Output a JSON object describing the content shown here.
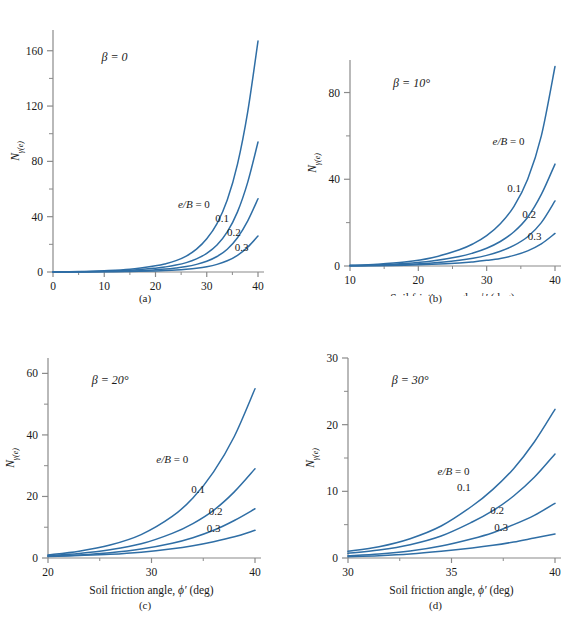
{
  "figure": {
    "background": "#ffffff",
    "curve_color": "#2f6ea5",
    "axis_color": "#8a8a8a",
    "text_color": "#1a1a1a"
  },
  "common": {
    "xlabel_prefix": "Soil friction angle,",
    "xlabel_symbol": "ϕ′",
    "xlabel_suffix": "(deg)",
    "ylabel_base": "N",
    "ylabel_sub": "γ(e)",
    "series_label_lead": "e/B = 0",
    "series_labels": [
      "e/B = 0",
      "0.1",
      "0.2",
      "0.3"
    ]
  },
  "chart_data": [
    {
      "id": "a",
      "caption": "(a)",
      "type": "line",
      "title": "",
      "annotation": "β = 0",
      "beta": "β = 0",
      "xlabel": "Soil friction angle, ϕ′ (deg)",
      "ylabel": "Nγ(e)",
      "xlim": [
        0,
        40
      ],
      "ylim": [
        0,
        175
      ],
      "xticks": [
        0,
        10,
        20,
        30,
        40
      ],
      "xticklabels": [
        "0",
        "10",
        "20",
        "30",
        "40"
      ],
      "yticks": [
        0,
        40,
        80,
        120,
        160
      ],
      "yticklabels": [
        "0",
        "40",
        "80",
        "120",
        "160"
      ],
      "yminorticks": [
        20,
        60,
        100,
        140
      ],
      "grid": false,
      "legend": "inline-labels",
      "x": [
        0,
        5,
        10,
        15,
        20,
        22,
        24,
        26,
        28,
        30,
        32,
        34,
        36,
        38,
        40
      ],
      "series": [
        {
          "name": "e/B = 0",
          "label_xy": [
            27.5,
            46
          ],
          "values": [
            0,
            0.3,
            0.9,
            2.0,
            4.5,
            6.0,
            8.2,
            11.5,
            16.5,
            24.0,
            35.0,
            52.0,
            78.0,
            116.0,
            167.0
          ]
        },
        {
          "name": "0.1",
          "label_xy": [
            33.0,
            36
          ],
          "values": [
            0,
            0.2,
            0.5,
            1.2,
            2.8,
            3.7,
            5.0,
            6.8,
            9.5,
            13.5,
            19.5,
            29.0,
            43.5,
            65.0,
            94.0
          ]
        },
        {
          "name": "0.2",
          "label_xy": [
            35.3,
            26
          ],
          "values": [
            0,
            0.1,
            0.3,
            0.7,
            1.6,
            2.1,
            2.9,
            3.9,
            5.5,
            7.8,
            11.2,
            16.5,
            24.8,
            37.0,
            53.0
          ]
        },
        {
          "name": "0.3",
          "label_xy": [
            36.8,
            15
          ],
          "values": [
            0,
            0.05,
            0.15,
            0.35,
            0.8,
            1.05,
            1.4,
            1.95,
            2.7,
            3.8,
            5.5,
            8.1,
            12.1,
            18.0,
            26.0
          ]
        }
      ]
    },
    {
      "id": "b",
      "caption": "(b)",
      "type": "line",
      "title": "",
      "annotation": "β = 10°",
      "beta": "β = 10°",
      "xlabel": "Soil friction angle, ϕ′ (deg)",
      "ylabel": "Nγ(e)",
      "xlim": [
        10,
        40
      ],
      "ylim": [
        0,
        95
      ],
      "xticks": [
        10,
        20,
        30,
        40
      ],
      "xticklabels": [
        "10",
        "20",
        "30",
        "40"
      ],
      "yticks": [
        0,
        40,
        80
      ],
      "yticklabels": [
        "0",
        "40",
        "80"
      ],
      "yminorticks": [
        20,
        60
      ],
      "grid": false,
      "legend": "inline-labels",
      "x": [
        10,
        14,
        18,
        22,
        26,
        28,
        30,
        32,
        34,
        36,
        38,
        40
      ],
      "series": [
        {
          "name": "e/B = 0",
          "label_xy": [
            33.2,
            56
          ],
          "values": [
            0.3,
            0.8,
            1.8,
            3.8,
            7.5,
            10.2,
            14.0,
            19.5,
            27.5,
            40.0,
            60.0,
            92.0
          ]
        },
        {
          "name": "0.1",
          "label_xy": [
            34.0,
            34
          ],
          "values": [
            0.2,
            0.5,
            1.1,
            2.3,
            4.4,
            6.0,
            8.2,
            11.3,
            15.8,
            22.5,
            33.0,
            47.0
          ]
        },
        {
          "name": "0.2",
          "label_xy": [
            36.2,
            22
          ],
          "values": [
            0.1,
            0.3,
            0.65,
            1.4,
            2.7,
            3.6,
            4.9,
            6.8,
            9.5,
            13.5,
            20.0,
            30.0
          ]
        },
        {
          "name": "0.3",
          "label_xy": [
            37.0,
            12
          ],
          "values": [
            0.05,
            0.15,
            0.35,
            0.75,
            1.4,
            1.9,
            2.6,
            3.5,
            4.9,
            7.0,
            10.2,
            15.0
          ]
        }
      ]
    },
    {
      "id": "c",
      "caption": "(c)",
      "type": "line",
      "title": "",
      "annotation": "β = 20°",
      "beta": "β = 20°",
      "xlabel": "Soil friction angle, ϕ′ (deg)",
      "ylabel": "Nγ(e)",
      "xlim": [
        20,
        40
      ],
      "ylim": [
        0,
        65
      ],
      "xticks": [
        20,
        30,
        40
      ],
      "xticklabels": [
        "20",
        "30",
        "40"
      ],
      "yticks": [
        0,
        20,
        40,
        60
      ],
      "yticklabels": [
        "0",
        "20",
        "40",
        "60"
      ],
      "yminorticks": [
        10,
        30,
        50
      ],
      "grid": false,
      "legend": "inline-labels",
      "x": [
        20,
        23,
        26,
        29,
        32,
        34,
        36,
        38,
        40
      ],
      "series": [
        {
          "name": "e/B = 0",
          "label_xy": [
            32.0,
            31
          ],
          "values": [
            1.0,
            2.2,
            4.2,
            7.6,
            13.5,
            19.5,
            28.0,
            39.5,
            55.0
          ]
        },
        {
          "name": "0.1",
          "label_xy": [
            34.5,
            21
          ],
          "values": [
            0.8,
            1.5,
            2.7,
            4.6,
            8.0,
            11.2,
            15.5,
            21.5,
            29.0
          ]
        },
        {
          "name": "0.2",
          "label_xy": [
            36.2,
            14
          ],
          "values": [
            0.6,
            1.0,
            1.7,
            2.9,
            4.8,
            6.6,
            9.0,
            12.2,
            16.0
          ]
        },
        {
          "name": "0.3",
          "label_xy": [
            36.0,
            8.5
          ],
          "values": [
            0.5,
            0.8,
            1.2,
            1.9,
            3.0,
            4.0,
            5.3,
            6.9,
            9.0
          ]
        }
      ]
    },
    {
      "id": "d",
      "caption": "(d)",
      "type": "line",
      "title": "",
      "annotation": "β = 30°",
      "beta": "β = 30°",
      "xlabel": "Soil friction angle, ϕ′ (deg)",
      "ylabel": "Nγ(e)",
      "xlim": [
        30,
        40
      ],
      "ylim": [
        0,
        30
      ],
      "xticks": [
        30,
        35,
        40
      ],
      "xticklabels": [
        "30",
        "35",
        "40"
      ],
      "yticks": [
        0,
        10,
        20,
        30
      ],
      "yticklabels": [
        "0",
        "10",
        "20",
        "30"
      ],
      "yminorticks": [
        5,
        15,
        25
      ],
      "grid": false,
      "legend": "inline-labels",
      "x": [
        30,
        31.5,
        33,
        34.5,
        36,
        37,
        38,
        39,
        40
      ],
      "series": [
        {
          "name": "e/B = 0",
          "label_xy": [
            35.1,
            12.4
          ],
          "values": [
            1.0,
            1.7,
            2.9,
            4.8,
            7.8,
            10.3,
            13.4,
            17.4,
            22.3
          ]
        },
        {
          "name": "0.1",
          "label_xy": [
            35.6,
            10.0
          ],
          "values": [
            0.7,
            1.2,
            2.0,
            3.3,
            5.4,
            7.1,
            9.3,
            12.1,
            15.6
          ]
        },
        {
          "name": "0.2",
          "label_xy": [
            37.2,
            6.6
          ],
          "values": [
            0.35,
            0.6,
            1.05,
            1.8,
            2.9,
            3.8,
            5.0,
            6.4,
            8.2
          ]
        },
        {
          "name": "0.3",
          "label_xy": [
            37.4,
            4.1
          ],
          "values": [
            0.2,
            0.35,
            0.6,
            1.0,
            1.5,
            1.9,
            2.4,
            3.0,
            3.6
          ]
        }
      ]
    }
  ]
}
